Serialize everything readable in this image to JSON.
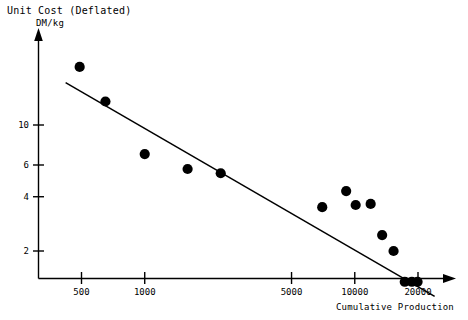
{
  "chart": {
    "title": "Unit Cost (Deflated)",
    "units_label": "DM/kg",
    "xlabel": "Cumulative Production"
  },
  "chart_data": {
    "type": "scatter",
    "title": "Unit Cost (Deflated)",
    "subtitle": "DM/kg",
    "xlabel": "Cumulative Production",
    "ylabel": "DM/kg",
    "xscale": "log",
    "yscale": "log",
    "grid": false,
    "legend": null,
    "xlim": [
      380,
      26000
    ],
    "ylim": [
      0.85,
      30
    ],
    "xticks": [
      500,
      1000,
      5000,
      10000,
      20000
    ],
    "xtick_labels": [
      "500",
      "1000",
      "5000",
      "10000",
      "20000"
    ],
    "yticks": [
      2,
      4,
      6,
      10
    ],
    "ytick_labels": [
      "2",
      "4",
      "6",
      "10"
    ],
    "points": [
      {
        "x": 490,
        "y": 21.0
      },
      {
        "x": 650,
        "y": 13.5
      },
      {
        "x": 1000,
        "y": 6.9
      },
      {
        "x": 1600,
        "y": 5.7
      },
      {
        "x": 2300,
        "y": 5.4
      },
      {
        "x": 7000,
        "y": 3.5
      },
      {
        "x": 9100,
        "y": 4.3
      },
      {
        "x": 10100,
        "y": 3.6
      },
      {
        "x": 11900,
        "y": 3.65
      },
      {
        "x": 13500,
        "y": 2.45
      },
      {
        "x": 15300,
        "y": 2.0
      },
      {
        "x": 17300,
        "y": 1.35
      },
      {
        "x": 18700,
        "y": 1.35
      },
      {
        "x": 19900,
        "y": 1.35
      }
    ],
    "trendline": {
      "type": "power-law-fit",
      "x_start": 420,
      "y_start": 17.2,
      "x_end": 24000,
      "y_end": 1.12
    }
  },
  "axes": {
    "y_ticks": [
      {
        "label": "10",
        "value": 10
      },
      {
        "label": "6",
        "value": 6
      },
      {
        "label": "4",
        "value": 4
      },
      {
        "label": "2",
        "value": 2
      }
    ],
    "x_ticks": [
      {
        "label": "500",
        "value": 500
      },
      {
        "label": "1000",
        "value": 1000
      },
      {
        "label": "5000",
        "value": 5000
      },
      {
        "label": "10000",
        "value": 10000
      },
      {
        "label": "20000",
        "value": 20000
      }
    ]
  },
  "colors": {
    "axis": "#000000",
    "marker": "#000000",
    "trendline": "#000000",
    "background": "#ffffff"
  }
}
